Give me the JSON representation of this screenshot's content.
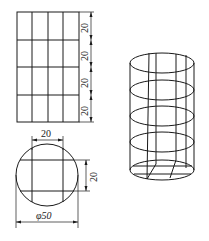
{
  "figure": {
    "type": "technical drawing",
    "grid_view": {
      "rows": 4,
      "columns": 4,
      "row_dimensions": [
        "20",
        "20",
        "20",
        "20"
      ],
      "column_dimension": "20"
    },
    "circle_view": {
      "diameter_label": "φ50",
      "width_dimension": "20",
      "height_dimension": "20"
    },
    "cylinder_view": {
      "rings": 5,
      "vertical_lines": 5
    }
  },
  "labels": {
    "dim_row_1": "20",
    "dim_row_2": "20",
    "dim_row_3": "20",
    "dim_row_4": "20",
    "dim_top_width": "20",
    "dim_side_height": "20",
    "dim_diameter": "φ50"
  }
}
